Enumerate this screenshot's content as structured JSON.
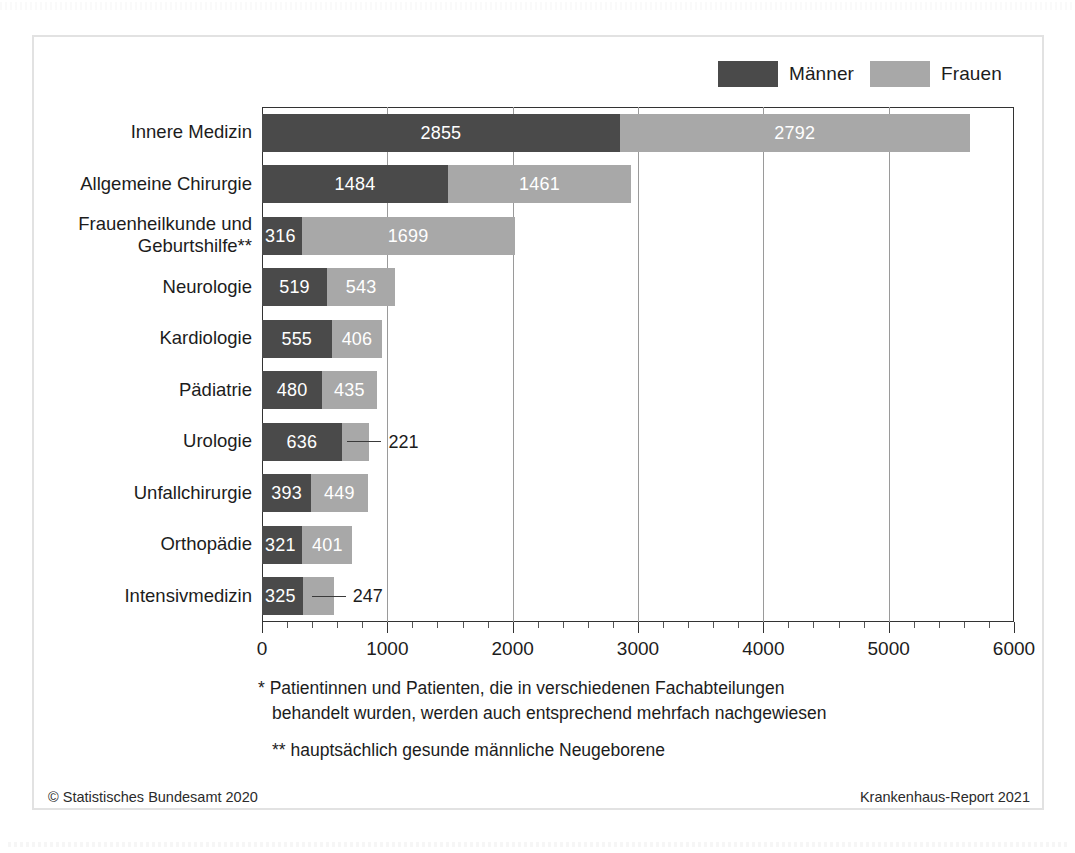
{
  "legend": {
    "entries": [
      {
        "label": "Männer",
        "color": "#4a4a4a"
      },
      {
        "label": "Frauen",
        "color": "#a8a8a8"
      }
    ]
  },
  "footnotes": {
    "line1a": "* Patientinnen und Patienten, die in verschiedenen Fachabteilungen",
    "line1b": "behandelt wurden, werden auch entsprechend mehrfach nachgewiesen",
    "line2": "** hauptsächlich gesunde männliche Neugeborene"
  },
  "credits": {
    "left": "© Statistisches Bundesamt 2020",
    "right": "Krankenhaus-Report 2021"
  },
  "chart_data": {
    "type": "bar",
    "orientation": "horizontal",
    "stacked": true,
    "title": "",
    "xlabel": "",
    "ylabel": "",
    "xlim": [
      0,
      6000
    ],
    "xticks": [
      0,
      1000,
      2000,
      3000,
      4000,
      5000,
      6000
    ],
    "xticklabels": [
      "0",
      "1000",
      "2000",
      "3000",
      "4000",
      "5000",
      "6000"
    ],
    "minor_tick_step": 200,
    "grid": "vertical-major",
    "legend_position": "top-right",
    "categories": [
      "Innere Medizin",
      "Allgemeine Chirurgie",
      "Frauenheilkunde und Geburtshilfe**",
      "Neurologie",
      "Kardiologie",
      "Pädiatrie",
      "Urologie",
      "Unfallchirurgie",
      "Orthopädie",
      "Intensivmedizin"
    ],
    "category_lines": [
      [
        "Innere Medizin"
      ],
      [
        "Allgemeine Chirurgie"
      ],
      [
        "Frauenheilkunde und",
        "Geburtshilfe**"
      ],
      [
        "Neurologie"
      ],
      [
        "Kardiologie"
      ],
      [
        "Pädiatrie"
      ],
      [
        "Urologie"
      ],
      [
        "Unfallchirurgie"
      ],
      [
        "Orthopädie"
      ],
      [
        "Intensivmedizin"
      ]
    ],
    "series": [
      {
        "name": "Männer",
        "color": "#4a4a4a",
        "values": [
          2855,
          1484,
          316,
          519,
          555,
          480,
          636,
          393,
          321,
          325
        ]
      },
      {
        "name": "Frauen",
        "color": "#a8a8a8",
        "values": [
          2792,
          1461,
          1699,
          543,
          406,
          435,
          221,
          449,
          401,
          247
        ]
      }
    ],
    "totals": [
      5647,
      2945,
      2015,
      1062,
      961,
      915,
      857,
      842,
      722,
      572
    ],
    "outside_labels": [
      {
        "category": "Urologie",
        "series": "Frauen",
        "value": 221
      },
      {
        "category": "Intensivmedizin",
        "series": "Frauen",
        "value": 247
      }
    ]
  }
}
